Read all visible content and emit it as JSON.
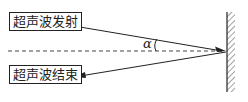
{
  "diagram": {
    "labels": {
      "emit": "超声波发射",
      "end": "超声波结束",
      "angle": "α"
    },
    "colors": {
      "line": "#222222",
      "background": "#ffffff"
    }
  }
}
